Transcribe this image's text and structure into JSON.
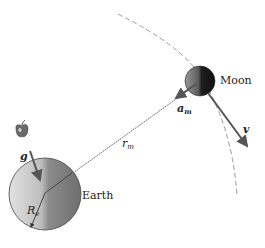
{
  "diagram": {
    "type": "physics-illustration",
    "labels": {
      "moon": "Moon",
      "earth": "Earth",
      "acceleration_moon": {
        "main": "a",
        "sub": "m"
      },
      "velocity": "v",
      "gravity": "g",
      "distance": {
        "main": "r",
        "sub": "m"
      },
      "earth_radius": {
        "main": "R",
        "sub": "e"
      }
    },
    "colors": {
      "earth_light": "#d8d8d8",
      "earth_dark": "#7a7a7a",
      "moon_light": "#8a8a8a",
      "moon_dark": "#1a1a1a",
      "arrow": "#555555",
      "orbit": "#999999",
      "line": "#444444"
    },
    "elements": [
      {
        "name": "orbit-arc",
        "style": "dashed"
      },
      {
        "name": "moon",
        "shape": "circle"
      },
      {
        "name": "earth",
        "shape": "circle"
      },
      {
        "name": "apple",
        "shape": "icon"
      },
      {
        "name": "radius-line",
        "style": "thin-line"
      },
      {
        "name": "acceleration-arrow"
      },
      {
        "name": "velocity-arrow"
      },
      {
        "name": "gravity-arrow"
      },
      {
        "name": "earth-radius-arrow"
      }
    ]
  }
}
